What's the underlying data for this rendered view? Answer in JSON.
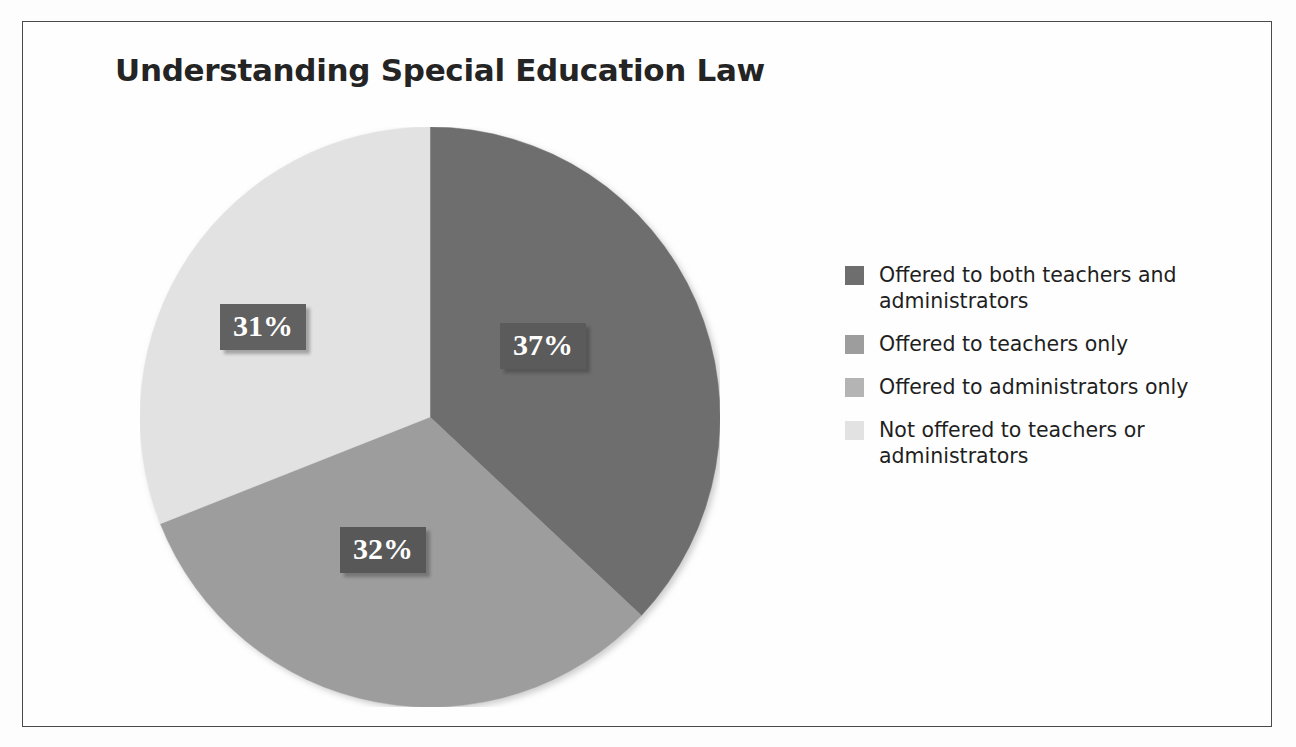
{
  "chart_data": {
    "type": "pie",
    "title": "Understanding Special Education Law",
    "categories": [
      "Offered to both teachers and administrators",
      "Offered to teachers only",
      "Offered to administrators only",
      "Not offered to teachers or administrators"
    ],
    "values": [
      37,
      32,
      0,
      31
    ],
    "value_labels": [
      "37%",
      "32%",
      "",
      "31%"
    ],
    "colors": [
      "#6e6e6e",
      "#9d9d9d",
      "#b4b4b4",
      "#e2e2e2"
    ],
    "legend_position": "right",
    "grid": false,
    "xlabel": "",
    "ylabel": ""
  },
  "title": "Understanding Special Education Law",
  "slices": [
    {
      "label": "37%",
      "value": 37,
      "color": "#6e6e6e"
    },
    {
      "label": "32%",
      "value": 32,
      "color": "#9d9d9d"
    },
    {
      "label": "31%",
      "value": 31,
      "color": "#e2e2e2"
    }
  ],
  "legend": {
    "items": [
      {
        "label": "Offered to both teachers and administrators",
        "color": "#6e6e6e"
      },
      {
        "label": "Offered to teachers only",
        "color": "#9d9d9d"
      },
      {
        "label": "Offered to administrators only",
        "color": "#b4b4b4"
      },
      {
        "label": "Not offered to teachers or administrators",
        "color": "#e2e2e2"
      }
    ]
  }
}
